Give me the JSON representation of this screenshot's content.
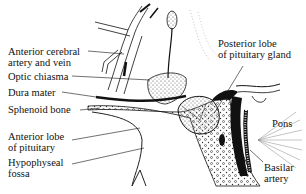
{
  "diagram": {
    "labels": {
      "anterior_cerebral": [
        "Anterior cerebral",
        "artery and vein"
      ],
      "optic_chiasma": "Optic chiasma",
      "dura_mater": "Dura mater",
      "sphenoid_bone": "Sphenoid bone",
      "anterior_lobe": [
        "Anterior lobe",
        "of pituitary"
      ],
      "hypophyseal_fossa": [
        "Hypophyseal",
        "fossa"
      ],
      "posterior_lobe": [
        "Posterior lobe",
        "of pituitary gland"
      ],
      "pons": "Pons",
      "basilar_artery": [
        "Basilar",
        "artery"
      ]
    },
    "colors": {
      "ink": "#111111",
      "background": "#ffffff",
      "stipple": "#555555"
    }
  }
}
